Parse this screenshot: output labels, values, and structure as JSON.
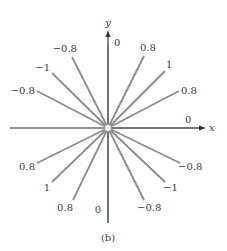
{
  "figure": {
    "caption": "(b)",
    "axes": {
      "x_label": "x",
      "y_label": "y",
      "origin": [
        108,
        128
      ],
      "x_range": [
        10,
        206
      ],
      "y_range": [
        30,
        223
      ],
      "axis_color": "#6b6b6b"
    },
    "line_color": "#8c8c8c",
    "rays": [
      {
        "id": "ray-up",
        "end": [
          108,
          44
        ],
        "label": "0",
        "label_pos": [
          114,
          46
        ],
        "anchor": "start"
      },
      {
        "id": "ray-up-right-1",
        "end": [
          144,
          56
        ],
        "label": "0.8",
        "label_pos": [
          140,
          51
        ],
        "anchor": "start"
      },
      {
        "id": "ray-up-right-2",
        "end": [
          165,
          71
        ],
        "label": "1",
        "label_pos": [
          166,
          68
        ],
        "anchor": "start"
      },
      {
        "id": "ray-up-right-3",
        "end": [
          179,
          91
        ],
        "label": "0.8",
        "label_pos": [
          181,
          94
        ],
        "anchor": "start"
      },
      {
        "id": "ray-right",
        "end": [
          200,
          128
        ],
        "label": "0",
        "label_pos": [
          185,
          123
        ],
        "anchor": "start"
      },
      {
        "id": "ray-down-right-1",
        "end": [
          180,
          163
        ],
        "label": "−0.8",
        "label_pos": [
          178,
          170
        ],
        "anchor": "start"
      },
      {
        "id": "ray-down-right-2",
        "end": [
          165,
          182
        ],
        "label": "−1",
        "label_pos": [
          163,
          191
        ],
        "anchor": "start"
      },
      {
        "id": "ray-down-right-3",
        "end": [
          144,
          200
        ],
        "label": "−0.8",
        "label_pos": [
          137,
          211
        ],
        "anchor": "start"
      },
      {
        "id": "ray-down",
        "end": [
          108,
          223
        ],
        "label": "0",
        "label_pos": [
          101,
          213
        ],
        "anchor": "end"
      },
      {
        "id": "ray-down-left-1",
        "end": [
          73,
          200
        ],
        "label": "0.8",
        "label_pos": [
          73,
          211
        ],
        "anchor": "end"
      },
      {
        "id": "ray-down-left-2",
        "end": [
          52,
          182
        ],
        "label": "1",
        "label_pos": [
          50,
          191
        ],
        "anchor": "end"
      },
      {
        "id": "ray-down-left-3",
        "end": [
          37,
          163
        ],
        "label": "0.8",
        "label_pos": [
          35,
          170
        ],
        "anchor": "end"
      },
      {
        "id": "ray-up-left-3",
        "end": [
          37,
          91
        ],
        "label": "−0.8",
        "label_pos": [
          35,
          94
        ],
        "anchor": "end"
      },
      {
        "id": "ray-up-left-2",
        "end": [
          52,
          73
        ],
        "label": "−1",
        "label_pos": [
          50,
          71
        ],
        "anchor": "end"
      },
      {
        "id": "ray-up-left-1",
        "end": [
          72,
          57
        ],
        "label": "−0.8",
        "label_pos": [
          77,
          52
        ],
        "anchor": "end"
      }
    ]
  }
}
